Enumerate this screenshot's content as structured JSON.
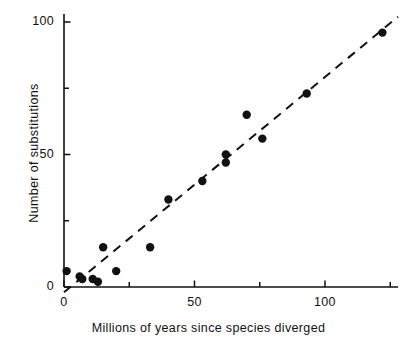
{
  "chart_data": {
    "type": "scatter",
    "title": "",
    "xlabel": "Millions of years since species diverged",
    "ylabel": "Number of substitutions",
    "xlim": [
      0,
      128
    ],
    "ylim": [
      0,
      103
    ],
    "grid": false,
    "legend": null,
    "xticks": [
      {
        "value": 0,
        "label": "0",
        "major": true
      },
      {
        "value": 25,
        "label": "",
        "major": false
      },
      {
        "value": 50,
        "label": "50",
        "major": true
      },
      {
        "value": 75,
        "label": "",
        "major": false
      },
      {
        "value": 100,
        "label": "100",
        "major": true
      },
      {
        "value": 125,
        "label": "",
        "major": false
      }
    ],
    "yticks": [
      {
        "value": 0,
        "label": "0",
        "major": true
      },
      {
        "value": 25,
        "label": "",
        "major": false
      },
      {
        "value": 50,
        "label": "50",
        "major": true
      },
      {
        "value": 75,
        "label": "",
        "major": false
      },
      {
        "value": 100,
        "label": "100",
        "major": true
      }
    ],
    "points": [
      {
        "x": 1,
        "y": 6
      },
      {
        "x": 6,
        "y": 4
      },
      {
        "x": 7,
        "y": 3
      },
      {
        "x": 11,
        "y": 3
      },
      {
        "x": 13,
        "y": 2
      },
      {
        "x": 15,
        "y": 15
      },
      {
        "x": 20,
        "y": 6
      },
      {
        "x": 33,
        "y": 15
      },
      {
        "x": 40,
        "y": 33
      },
      {
        "x": 53,
        "y": 40
      },
      {
        "x": 62,
        "y": 47
      },
      {
        "x": 62,
        "y": 50
      },
      {
        "x": 70,
        "y": 65
      },
      {
        "x": 76,
        "y": 56
      },
      {
        "x": 93,
        "y": 73
      },
      {
        "x": 122,
        "y": 96
      }
    ],
    "trendline": {
      "style": "dashed",
      "x0": 0,
      "y0": -2,
      "x1": 128,
      "y1": 102
    },
    "marker": {
      "shape": "circle",
      "color": "#111111",
      "radius_px": 4.2
    },
    "axis_color": "#111111"
  }
}
